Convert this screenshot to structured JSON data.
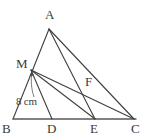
{
  "figure": {
    "type": "geometry-diagram",
    "stroke_color": "#3f3f3f",
    "baseline_color": "#585858",
    "background_color": "#ffffff",
    "points": {
      "A": {
        "label": "A",
        "x": 49,
        "y": 29
      },
      "B": {
        "label": "B",
        "x": 13,
        "y": 119
      },
      "C": {
        "label": "C",
        "x": 134,
        "y": 119
      },
      "M": {
        "label": "M",
        "x": 31,
        "y": 70
      },
      "D": {
        "label": "D",
        "x": 52,
        "y": 119
      },
      "E": {
        "label": "E",
        "x": 95,
        "y": 119
      },
      "F": {
        "label": "F",
        "x": 83,
        "y": 90
      }
    },
    "segments": [
      {
        "name": "A-B-side",
        "from": "A",
        "to": "B"
      },
      {
        "name": "B-C-base",
        "from": "B",
        "to": "C"
      },
      {
        "name": "A-C-side",
        "from": "A",
        "to": "C"
      },
      {
        "name": "A-E-cevian",
        "from": "A",
        "to": "E"
      },
      {
        "name": "M-C-cevian",
        "from": "M",
        "to": "C"
      },
      {
        "name": "M-D-cevian",
        "from": "M",
        "to": "D"
      },
      {
        "name": "M-E-cevian",
        "from": "M",
        "to": "E"
      }
    ],
    "labels": {
      "A": "A",
      "B": "B",
      "C": "C",
      "D": "D",
      "E": "E",
      "F": "F",
      "M": "M"
    },
    "measurement": {
      "text": "8 cm",
      "value": 8,
      "unit": "cm",
      "refers_to": "B-M"
    }
  }
}
